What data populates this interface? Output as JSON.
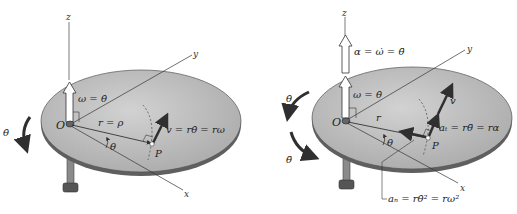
{
  "figures": [
    {
      "id": "rotation-velocity",
      "labels": {
        "z_axis": "z",
        "y_axis": "y",
        "x_axis": "x",
        "origin": "O",
        "point": "P",
        "omega": "ω = θ̇",
        "radius": "r = ρ",
        "angle": "θ",
        "velocity": "v = rθ̇ = rω",
        "theta_dot": "θ̇"
      }
    },
    {
      "id": "rotation-acceleration",
      "labels": {
        "z_axis": "z",
        "y_axis": "y",
        "x_axis": "x",
        "origin": "O",
        "point": "P",
        "alpha": "α = ω̇ = θ̈",
        "omega": "ω = θ̇",
        "radius": "r",
        "angle": "θ",
        "velocity": "v",
        "tangential_accel": "aₜ = rθ̈ = rα",
        "normal_accel": "aₙ = rθ̇² = rω²",
        "theta_dot": "θ̇",
        "theta_ddot": "θ̈"
      }
    }
  ],
  "colors": {
    "disk_top": "#b9b9b9",
    "disk_edge": "#6d6d6d",
    "line": "#333333",
    "vector": "#2f2f2f"
  }
}
